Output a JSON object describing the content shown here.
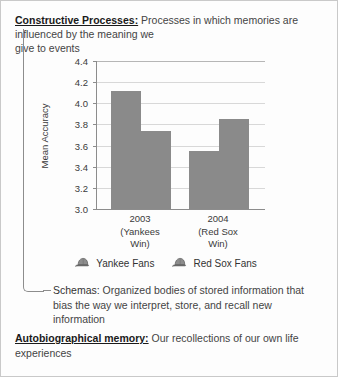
{
  "entries": [
    {
      "term": "Constructive Processes:",
      "term_style": "bold-underline",
      "definition_lines": [
        "Processes in which memories are",
        "influenced by the meaning we",
        "give to events"
      ]
    },
    {
      "term": "Schemas:",
      "term_style": "plain",
      "definition_lines": [
        "Organized bodies of stored information",
        "that bias the way we interpret, store, and recall",
        "new information"
      ]
    },
    {
      "term": "Autobiographical memory:",
      "term_style": "bold-underline",
      "definition_lines": [
        "Our recollections of our own",
        "life experiences"
      ]
    }
  ],
  "chart_data": {
    "type": "bar",
    "title": "",
    "xlabel": "",
    "ylabel": "Mean Accuracy",
    "ylim": [
      3.0,
      4.4
    ],
    "ytick_step": 0.2,
    "yticks": [
      "4.4",
      "4.2",
      "4.0",
      "3.8",
      "3.6",
      "3.4",
      "3.2",
      "3.0"
    ],
    "grid": true,
    "legend_position": "bottom",
    "categories": [
      "2003",
      "2004"
    ],
    "category_sublabels": [
      "(Yankees Win)",
      "(Red Sox Win)"
    ],
    "series": [
      {
        "name": "Yankee Fans",
        "values": [
          4.12,
          3.55
        ],
        "color": "#8a8a8a",
        "icon": "baseball-cap-icon"
      },
      {
        "name": "Red Sox Fans",
        "values": [
          3.74,
          3.85
        ],
        "color": "#8a8a8a",
        "icon": "baseball-cap-icon"
      }
    ]
  },
  "colors": {
    "bar": "#8a8a8a",
    "axis": "#8c8c8c",
    "grid": "#d8d8d8",
    "card_border": "#c9c9c9",
    "connector": "#8d8d8d"
  }
}
